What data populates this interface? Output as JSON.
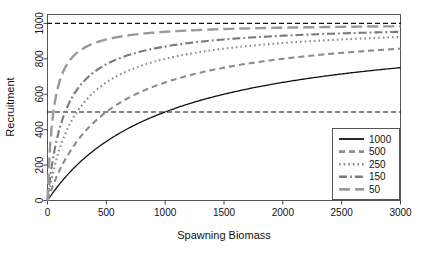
{
  "chart_data": {
    "type": "line",
    "title": "",
    "xlabel": "Spawning Biomass",
    "ylabel": "Recruitment",
    "xlim": [
      0,
      3000
    ],
    "ylim": [
      0,
      1050
    ],
    "xticks": [
      0,
      500,
      1000,
      1500,
      2000,
      2500,
      3000
    ],
    "yticks": [
      0,
      200,
      400,
      600,
      800,
      1000
    ],
    "grid": false,
    "legend_position": "bottom-right",
    "legend_title": "",
    "reference_lines": [
      {
        "axis": "y",
        "value": 1000,
        "style": "dashed",
        "color": "#111111"
      },
      {
        "axis": "y",
        "value": 500,
        "style": "dashed",
        "color": "#111111"
      }
    ],
    "x": [
      0,
      50,
      100,
      150,
      200,
      250,
      300,
      400,
      500,
      600,
      700,
      800,
      900,
      1000,
      1200,
      1400,
      1600,
      1800,
      2000,
      2200,
      2400,
      2600,
      2800,
      3000
    ],
    "series": [
      {
        "name": "1000",
        "label": "1000",
        "color": "#111111",
        "dash": "solid",
        "half_saturation": 1000,
        "asymptote": 1000,
        "values": [
          0,
          48,
          91,
          130,
          167,
          200,
          231,
          286,
          333,
          375,
          412,
          444,
          474,
          500,
          545,
          583,
          615,
          643,
          667,
          688,
          706,
          722,
          737,
          750
        ]
      },
      {
        "name": "500",
        "label": "500",
        "color": "#8c8c8c",
        "dash": "medium-dash",
        "half_saturation": 500,
        "asymptote": 1000,
        "values": [
          0,
          91,
          167,
          231,
          286,
          333,
          375,
          444,
          500,
          545,
          583,
          615,
          643,
          667,
          706,
          737,
          762,
          783,
          800,
          815,
          828,
          839,
          848,
          857
        ]
      },
      {
        "name": "250",
        "label": "250",
        "color": "#8c8c8c",
        "dash": "dotted",
        "half_saturation": 250,
        "asymptote": 1000,
        "values": [
          0,
          167,
          286,
          375,
          444,
          500,
          545,
          615,
          667,
          706,
          737,
          762,
          783,
          800,
          828,
          848,
          865,
          878,
          889,
          898,
          906,
          912,
          918,
          923
        ]
      },
      {
        "name": "150",
        "label": "150",
        "color": "#7a7a7a",
        "dash": "dash-dot",
        "half_saturation": 150,
        "asymptote": 1000,
        "values": [
          0,
          250,
          400,
          500,
          571,
          625,
          667,
          727,
          769,
          800,
          824,
          842,
          857,
          870,
          889,
          903,
          914,
          923,
          930,
          936,
          941,
          945,
          949,
          952
        ]
      },
      {
        "name": "50",
        "label": "50",
        "color": "#9a9a9a",
        "dash": "long-dash",
        "half_saturation": 50,
        "asymptote": 1000,
        "values": [
          0,
          500,
          667,
          750,
          800,
          833,
          857,
          889,
          909,
          923,
          933,
          941,
          947,
          952,
          960,
          966,
          970,
          973,
          976,
          978,
          980,
          981,
          982,
          984
        ]
      }
    ]
  },
  "axes": {
    "x_title": "Spawning Biomass",
    "y_title": "Recruitment",
    "x_tick_labels": [
      "0",
      "500",
      "1000",
      "1500",
      "2000",
      "2500",
      "3000"
    ],
    "y_tick_labels": [
      "0",
      "200",
      "400",
      "600",
      "800",
      "1000"
    ]
  },
  "legend": {
    "entries": [
      {
        "label": "1000"
      },
      {
        "label": "500"
      },
      {
        "label": "250"
      },
      {
        "label": "150"
      },
      {
        "label": "50"
      }
    ]
  },
  "colors": {
    "solid_black": "#111111",
    "gray_mid": "#8c8c8c",
    "gray_light": "#9a9a9a",
    "frame": "#555555",
    "background": "#ffffff"
  }
}
